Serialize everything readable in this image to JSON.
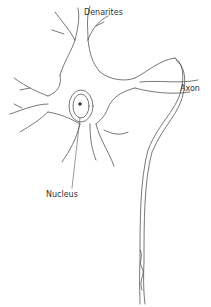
{
  "diagram": {
    "labels": {
      "dendrites": "Denarites",
      "axon": "Axon",
      "nucleus": "Nucleus"
    },
    "colors": {
      "line": "#555555",
      "background": "#ffffff"
    }
  }
}
